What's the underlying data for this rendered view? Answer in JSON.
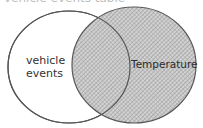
{
  "title_clipped": "vehicle events table",
  "venn": {
    "left_set": {
      "label_line1": "vehicle",
      "label_line2": "events",
      "fill": "#ffffff"
    },
    "right_set": {
      "label": "Temperature",
      "fill": "hatched-gray"
    },
    "stroke_color": "#555555",
    "hatch_color": "#8c8c8c"
  }
}
